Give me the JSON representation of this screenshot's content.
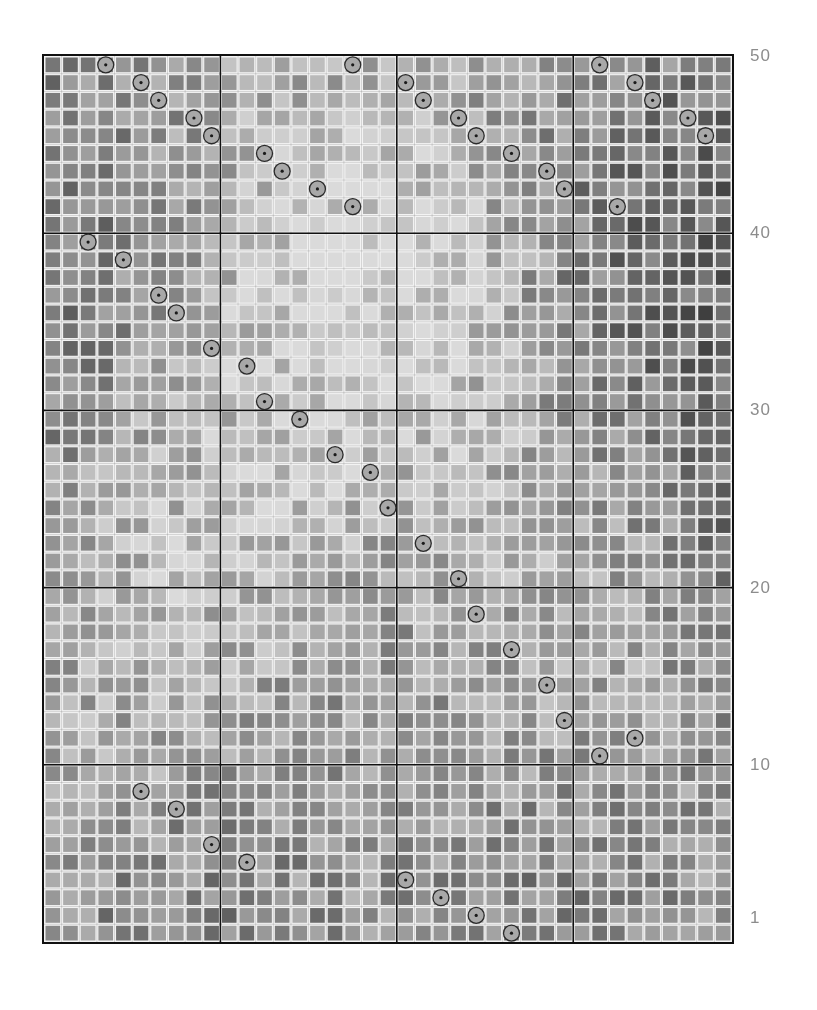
{
  "figure": {
    "title": "",
    "width": 817,
    "height": 1010,
    "background": "#ffffff"
  },
  "chart_data": {
    "type": "heatmap",
    "title": "",
    "xlabel": "",
    "ylabel": "",
    "grid": true,
    "legend": false,
    "n_rows": 50,
    "n_cols": 39,
    "row_axis_side": "right",
    "ylim": [
      1,
      50
    ],
    "y_tick_labels": [
      "50",
      "40",
      "30",
      "20",
      "10",
      "1"
    ],
    "y_tick_values": [
      50,
      40,
      30,
      20,
      10,
      1
    ],
    "colormap": "grayscale",
    "value_range": [
      0,
      1
    ],
    "cell_colors": {
      "darkest": "#3f3f3f",
      "dark": "#5a5a5a",
      "mid": "#8f8f8f",
      "light": "#bdbdbd",
      "lightest": "#d8d8d8",
      "gap": "#f4f4f4"
    },
    "panel_divider_color": "#111111",
    "column_group_boundaries": [
      10,
      20,
      30
    ],
    "row_group_boundaries": [
      10,
      20,
      30,
      40
    ],
    "marker": {
      "shape": "circle",
      "fill": "#a8a8a8",
      "stroke": "#2b2b2b",
      "center_dot": "#1a1a1a",
      "radius_px": 8,
      "count": 50,
      "description": "one highlighted cell per row"
    },
    "marker_points": [
      {
        "row": 50,
        "col": 3
      },
      {
        "row": 50,
        "col": 17
      },
      {
        "row": 50,
        "col": 31
      },
      {
        "row": 49,
        "col": 5
      },
      {
        "row": 49,
        "col": 20
      },
      {
        "row": 49,
        "col": 33
      },
      {
        "row": 48,
        "col": 6
      },
      {
        "row": 48,
        "col": 21
      },
      {
        "row": 48,
        "col": 34
      },
      {
        "row": 47,
        "col": 8
      },
      {
        "row": 47,
        "col": 23
      },
      {
        "row": 47,
        "col": 36
      },
      {
        "row": 46,
        "col": 9
      },
      {
        "row": 46,
        "col": 24
      },
      {
        "row": 46,
        "col": 37
      },
      {
        "row": 45,
        "col": 12
      },
      {
        "row": 45,
        "col": 26
      },
      {
        "row": 44,
        "col": 13
      },
      {
        "row": 44,
        "col": 28
      },
      {
        "row": 43,
        "col": 15
      },
      {
        "row": 43,
        "col": 29
      },
      {
        "row": 42,
        "col": 17
      },
      {
        "row": 42,
        "col": 32
      },
      {
        "row": 40,
        "col": 2
      },
      {
        "row": 39,
        "col": 4
      },
      {
        "row": 37,
        "col": 6
      },
      {
        "row": 36,
        "col": 7
      },
      {
        "row": 34,
        "col": 9
      },
      {
        "row": 33,
        "col": 11
      },
      {
        "row": 31,
        "col": 12
      },
      {
        "row": 30,
        "col": 14
      },
      {
        "row": 28,
        "col": 16
      },
      {
        "row": 27,
        "col": 18
      },
      {
        "row": 25,
        "col": 19
      },
      {
        "row": 23,
        "col": 21
      },
      {
        "row": 21,
        "col": 23
      },
      {
        "row": 19,
        "col": 24
      },
      {
        "row": 17,
        "col": 26
      },
      {
        "row": 15,
        "col": 28
      },
      {
        "row": 13,
        "col": 29
      },
      {
        "row": 11,
        "col": 31
      },
      {
        "row": 9,
        "col": 5
      },
      {
        "row": 8,
        "col": 7
      },
      {
        "row": 6,
        "col": 9
      },
      {
        "row": 5,
        "col": 11
      },
      {
        "row": 4,
        "col": 20
      },
      {
        "row": 3,
        "col": 22
      },
      {
        "row": 2,
        "col": 24
      },
      {
        "row": 1,
        "col": 26
      },
      {
        "row": 12,
        "col": 33
      }
    ]
  }
}
